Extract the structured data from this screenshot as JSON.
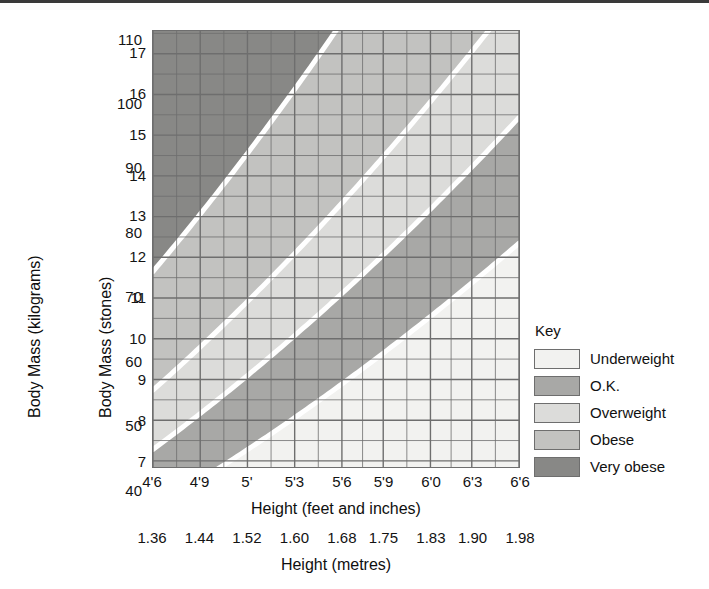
{
  "chart_data": {
    "type": "area",
    "xlabel": "Height (feet and inches)",
    "xlabel_secondary": "Height (metres)",
    "ylabel": "Body Mass (kilograms)",
    "ylabel_secondary": "Body Mass (stones)",
    "grid": true,
    "legend_position": "right",
    "x_axis_feet": {
      "label": "Height (feet and inches)",
      "ticks": [
        "4'6",
        "4'9",
        "5'",
        "5'3",
        "5'6",
        "5'9",
        "6'0",
        "6'3",
        "6'6"
      ]
    },
    "x_axis_metres": {
      "label": "Height (metres)",
      "ticks": [
        "1.36",
        "1.44",
        "1.52",
        "1.60",
        "1.68",
        "1.75",
        "1.83",
        "1.90",
        "1.98"
      ],
      "values": [
        1.36,
        1.44,
        1.52,
        1.6,
        1.68,
        1.75,
        1.83,
        1.9,
        1.98
      ],
      "xlim": [
        1.36,
        1.98
      ]
    },
    "y_axis_kilograms": {
      "label": "Body Mass (kilograms)",
      "ticks": [
        "40",
        "50",
        "60",
        "70",
        "80",
        "90",
        "100",
        "110"
      ],
      "values": [
        40,
        50,
        60,
        70,
        80,
        90,
        100,
        110
      ],
      "ylim": [
        43.5,
        111.5
      ]
    },
    "y_axis_stones": {
      "label": "Body Mass (stones)",
      "ticks": [
        "7",
        "8",
        "9",
        "10",
        "11",
        "12",
        "13",
        "14",
        "15",
        "16",
        "17"
      ],
      "values": [
        7,
        8,
        9,
        10,
        11,
        12,
        13,
        14,
        15,
        16,
        17
      ],
      "ylim": [
        6.85,
        17.55
      ]
    },
    "bands": [
      {
        "name": "Underweight",
        "bmi_min": 0,
        "bmi_max": 20,
        "color": "#f2f2f0"
      },
      {
        "name": "O.K.",
        "bmi_min": 20,
        "bmi_max": 25,
        "color": "#a8a8a6"
      },
      {
        "name": "Overweight",
        "bmi_min": 25,
        "bmi_max": 30,
        "color": "#dcdcda"
      },
      {
        "name": "Obese",
        "bmi_min": 30,
        "bmi_max": 40,
        "color": "#c2c2c0"
      },
      {
        "name": "Very obese",
        "bmi_min": 40,
        "bmi_max": 999,
        "color": "#888886"
      }
    ],
    "separator_color": "#ffffff"
  },
  "axes": {
    "y_kg_title": "Body Mass (kilograms)",
    "y_st_title": "Body Mass (stones)",
    "x_ft_title": "Height (feet and inches)",
    "x_m_title": "Height (metres)",
    "y_kg_ticks": [
      "110",
      "100",
      "90",
      "80",
      "70",
      "60",
      "50",
      "40"
    ],
    "y_st_ticks": [
      "17",
      "16",
      "15",
      "14",
      "13",
      "12",
      "11",
      "10",
      "9",
      "8",
      "7"
    ],
    "x_ft_ticks": [
      "4'6",
      "4'9",
      "5'",
      "5'3",
      "5'6",
      "5'9",
      "6'0",
      "6'3",
      "6'6"
    ],
    "x_m_ticks": [
      "1.36",
      "1.44",
      "1.52",
      "1.60",
      "1.68",
      "1.75",
      "1.83",
      "1.90",
      "1.98"
    ]
  },
  "key": {
    "title": "Key",
    "items": [
      {
        "label": "Underweight",
        "color": "#f2f2f0"
      },
      {
        "label": "O.K.",
        "color": "#a8a8a6"
      },
      {
        "label": "Overweight",
        "color": "#dcdcda"
      },
      {
        "label": "Obese",
        "color": "#c2c2c0"
      },
      {
        "label": "Very obese",
        "color": "#888886"
      }
    ]
  }
}
